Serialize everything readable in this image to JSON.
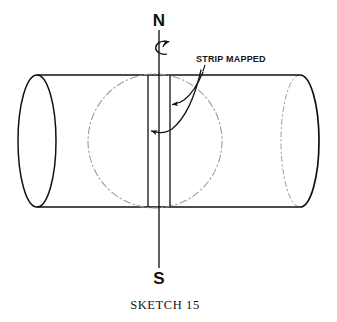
{
  "figure": {
    "caption": "SKETCH 15",
    "background_color": "#ffffff",
    "ink_color": "#111111",
    "hidden_line_color": "#9a9a9a"
  },
  "labels": {
    "north_pole": "N",
    "south_pole": "S",
    "strip_callout": "STRIP MAPPED"
  },
  "icons": {
    "rotation_arrow": "rotation-arrow-icon",
    "leader_arrow_right": "leader-arrow-icon",
    "leader_arrow_left": "leader-arrow-icon"
  },
  "geometry": {
    "cylinder": {
      "top_edge_y": 75,
      "bottom_edge_y": 207,
      "left_cap_center_x": 37,
      "right_cap_center_x": 300,
      "cap_rx": 19,
      "cap_ry": 66
    },
    "axis": {
      "x": 159,
      "top_y": 30,
      "bottom_y": 268
    },
    "great_circle": {
      "center_x": 155,
      "center_y": 141,
      "radius": 67,
      "style": "dash-dot"
    },
    "strip": {
      "left_boundary_x": 148,
      "right_boundary_x": 170,
      "top_y": 75,
      "bottom_y": 207
    }
  }
}
